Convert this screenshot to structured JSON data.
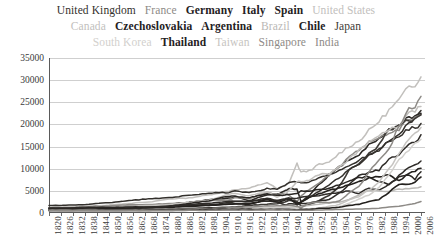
{
  "legend": {
    "rows": [
      [
        {
          "label": "United Kingdom",
          "color": "#33302c",
          "weight": "normal"
        },
        {
          "label": "France",
          "color": "#8d8a86",
          "weight": "normal"
        },
        {
          "label": "Germany",
          "color": "#24211e",
          "weight": "bold"
        },
        {
          "label": "Italy",
          "color": "#24211e",
          "weight": "bold"
        },
        {
          "label": "Spain",
          "color": "#24211e",
          "weight": "bold"
        },
        {
          "label": "United States",
          "color": "#c2c0bd",
          "weight": "normal"
        }
      ],
      [
        {
          "label": "Canada",
          "color": "#c2c0bd",
          "weight": "normal"
        },
        {
          "label": "Czechoslovakia",
          "color": "#24211e",
          "weight": "bold"
        },
        {
          "label": "Argentina",
          "color": "#24211e",
          "weight": "bold"
        },
        {
          "label": "Brazil",
          "color": "#bab8b5",
          "weight": "normal"
        },
        {
          "label": "Chile",
          "color": "#24211e",
          "weight": "bold"
        },
        {
          "label": "Japan",
          "color": "#3d3a36",
          "weight": "normal"
        }
      ],
      [
        {
          "label": "South Korea",
          "color": "#d2d0cd",
          "weight": "normal"
        },
        {
          "label": "Thailand",
          "color": "#24211e",
          "weight": "bold"
        },
        {
          "label": "Taiwan",
          "color": "#c6c4c1",
          "weight": "normal"
        },
        {
          "label": "Singapore",
          "color": "#8d8a86",
          "weight": "normal"
        },
        {
          "label": "India",
          "color": "#8d8a86",
          "weight": "normal"
        }
      ]
    ]
  },
  "chart_data": {
    "type": "line",
    "title": "",
    "xlabel": "",
    "ylabel": "",
    "grid": true,
    "legend_position": "top",
    "xlim": [
      1820,
      2008
    ],
    "ylim": [
      0,
      35000
    ],
    "yticks": [
      0,
      5000,
      10000,
      15000,
      20000,
      25000,
      30000,
      35000
    ],
    "ytick_labels": [
      "0",
      "5000",
      "10000",
      "15000",
      "20000",
      "25000",
      "30000",
      "35000"
    ],
    "xticks": [
      1820,
      1826,
      1832,
      1838,
      1844,
      1850,
      1856,
      1862,
      1868,
      1874,
      1880,
      1886,
      1892,
      1898,
      1904,
      1910,
      1916,
      1922,
      1928,
      1934,
      1940,
      1946,
      1952,
      1958,
      1964,
      1970,
      1976,
      1982,
      1988,
      1994,
      2000,
      2006
    ],
    "xtick_labels": [
      "1820",
      "1826",
      "1832",
      "1838",
      "1844",
      "1850",
      "1856",
      "1862",
      "1868",
      "1874",
      "1880",
      "1886",
      "1892",
      "1898",
      "1904",
      "1910",
      "1916",
      "1922",
      "1928",
      "1934",
      "1940",
      "1946",
      "1952",
      "1958",
      "1964",
      "1970",
      "1976",
      "1982",
      "1988",
      "1994",
      "2000",
      "2006"
    ],
    "x": [
      1820,
      1830,
      1840,
      1850,
      1860,
      1870,
      1880,
      1890,
      1900,
      1910,
      1913,
      1920,
      1929,
      1934,
      1938,
      1940,
      1944,
      1946,
      1950,
      1955,
      1960,
      1965,
      1970,
      1975,
      1980,
      1985,
      1990,
      1995,
      2000,
      2003,
      2006
    ],
    "series": [
      {
        "name": "United States",
        "color": "#c2c0bd",
        "width": 1.5,
        "values": [
          1257,
          1450,
          1588,
          1806,
          2178,
          2445,
          3184,
          3392,
          4091,
          4964,
          5301,
          5552,
          6899,
          5467,
          6126,
          6838,
          11138,
          9197,
          9561,
          10897,
          11328,
          13419,
          15030,
          16284,
          18577,
          20717,
          23201,
          25467,
          28467,
          29037,
          31178
        ]
      },
      {
        "name": "United Kingdom",
        "color": "#33302c",
        "width": 1.5,
        "values": [
          1706,
          1749,
          1990,
          2330,
          2830,
          3190,
          3477,
          4009,
          4492,
          4611,
          4921,
          4548,
          5503,
          5420,
          6266,
          6856,
          7056,
          6745,
          6939,
          7868,
          8645,
          9752,
          10767,
          11993,
          12931,
          14071,
          16430,
          17490,
          20353,
          21310,
          22693
        ]
      },
      {
        "name": "Germany",
        "color": "#2b2825",
        "width": 1.6,
        "values": [
          1077,
          1128,
          1428,
          1428,
          1639,
          1839,
          1991,
          2428,
          2985,
          3348,
          3648,
          2796,
          4051,
          4200,
          4994,
          5403,
          5403,
          2503,
          3881,
          6430,
          8463,
          10403,
          11993,
          13152,
          15370,
          16871,
          18685,
          19534,
          21812,
          21598,
          22300
        ]
      },
      {
        "name": "France",
        "color": "#8d8a86",
        "width": 1.5,
        "values": [
          1135,
          1205,
          1328,
          1597,
          1892,
          1876,
          2120,
          2376,
          2876,
          2965,
          3485,
          3227,
          4710,
          4192,
          4466,
          4042,
          2500,
          3817,
          5271,
          6739,
          8531,
          10409,
          12724,
          14282,
          16042,
          16760,
          18142,
          19012,
          21234,
          21459,
          22223
        ]
      },
      {
        "name": "Japan",
        "color": "#3d3a36",
        "width": 1.6,
        "values": [
          669,
          675,
          685,
          700,
          720,
          737,
          865,
          1012,
          1180,
          1301,
          1387,
          1696,
          2026,
          2120,
          2449,
          2874,
          2643,
          1555,
          1921,
          2771,
          3986,
          5934,
          9714,
          11344,
          13428,
          15331,
          18789,
          19979,
          21069,
          21218,
          22462
        ]
      },
      {
        "name": "Italy",
        "color": "#34312d",
        "width": 1.5,
        "values": [
          1117,
          1140,
          1172,
          1350,
          1459,
          1499,
          1581,
          1667,
          1785,
          2332,
          2564,
          2587,
          3093,
          2842,
          3244,
          3505,
          1809,
          2449,
          3502,
          4921,
          6352,
          7926,
          9719,
          11150,
          13149,
          14251,
          16313,
          17417,
          19054,
          19150,
          19800
        ]
      },
      {
        "name": "Spain",
        "color": "#2e2b28",
        "width": 1.5,
        "values": [
          1008,
          1048,
          1079,
          1079,
          1360,
          1207,
          1654,
          1847,
          1786,
          2056,
          2056,
          2177,
          2739,
          2504,
          1790,
          2080,
          1958,
          2118,
          2189,
          2737,
          3072,
          4429,
          6319,
          8346,
          9203,
          9722,
          12055,
          13217,
          15269,
          16021,
          17500
        ]
      },
      {
        "name": "Canada",
        "color": "#c2c0bd",
        "width": 1.5,
        "values": [
          904,
          900,
          1000,
          1330,
          1550,
          1695,
          1876,
          2378,
          2911,
          4213,
          4447,
          3911,
          4811,
          3600,
          4344,
          5065,
          7208,
          6968,
          7291,
          8753,
          8753,
          10573,
          12050,
          14101,
          16176,
          17694,
          18872,
          19661,
          22488,
          23000,
          24070
        ]
      },
      {
        "name": "Czechoslovakia",
        "color": "#24211e",
        "width": 1.6,
        "values": [
          849,
          860,
          892,
          937,
          1042,
          1164,
          1245,
          1505,
          1729,
          1991,
          2096,
          1933,
          3042,
          2443,
          2882,
          3200,
          2200,
          2430,
          3501,
          4310,
          5108,
          5600,
          6466,
          7041,
          7982,
          8232,
          8513,
          7327,
          8883,
          9500,
          10200
        ]
      },
      {
        "name": "Argentina",
        "color": "#2a2724",
        "width": 1.5,
        "values": [
          998,
          1015,
          1150,
          1250,
          1400,
          1311,
          1468,
          2152,
          2756,
          3822,
          3797,
          3473,
          4367,
          3969,
          4072,
          4161,
          4342,
          4969,
          4987,
          5237,
          5559,
          6371,
          7302,
          7971,
          8206,
          7094,
          6433,
          8137,
          8544,
          7666,
          9500
        ]
      },
      {
        "name": "Chile",
        "color": "#2e2b28",
        "width": 1.5,
        "values": [
          694,
          700,
          720,
          760,
          880,
          1290,
          1538,
          1870,
          2194,
          2653,
          2653,
          2548,
          3396,
          2768,
          3126,
          3188,
          3423,
          3506,
          3821,
          3855,
          4304,
          4543,
          5028,
          4323,
          5680,
          5145,
          6402,
          8473,
          10309,
          10700,
          11600
        ]
      },
      {
        "name": "Brazil",
        "color": "#bab8b5",
        "width": 1.5,
        "values": [
          646,
          640,
          655,
          686,
          710,
          713,
          784,
          794,
          678,
          769,
          811,
          963,
          1137,
          1113,
          1220,
          1250,
          1356,
          1442,
          1672,
          1970,
          2335,
          2449,
          3057,
          4048,
          5198,
          5004,
          4920,
          5331,
          5532,
          5563,
          5900
        ]
      },
      {
        "name": "Taiwan",
        "color": "#c6c4c1",
        "width": 1.5,
        "values": [
          500,
          510,
          520,
          530,
          545,
          560,
          580,
          616,
          759,
          790,
          860,
          948,
          1150,
          1233,
          1302,
          1330,
          1161,
          860,
          936,
          1085,
          1492,
          1885,
          2980,
          3669,
          5260,
          6916,
          9886,
          13174,
          16912,
          17900,
          19500
        ]
      },
      {
        "name": "South Korea",
        "color": "#d2d0cd",
        "width": 1.5,
        "values": [
          600,
          605,
          610,
          618,
          625,
          633,
          645,
          660,
          850,
          900,
          948,
          1038,
          1193,
          1250,
          1459,
          1500,
          1300,
          854,
          854,
          1061,
          1226,
          1436,
          2167,
          3162,
          4114,
          5670,
          8704,
          11873,
          14375,
          15732,
          17000
        ]
      },
      {
        "name": "Singapore",
        "color": "#8d8a86",
        "width": 1.5,
        "values": [
          683,
          690,
          700,
          712,
          728,
          745,
          760,
          780,
          1000,
          1150,
          1279,
          1350,
          1600,
          1600,
          1700,
          1750,
          1500,
          1159,
          2219,
          2523,
          2310,
          2667,
          4439,
          6070,
          9058,
          12240,
          14258,
          19947,
          23353,
          23800,
          26000
        ]
      },
      {
        "name": "Thailand",
        "color": "#24211e",
        "width": 1.6,
        "values": [
          570,
          575,
          580,
          590,
          600,
          608,
          617,
          634,
          812,
          830,
          841,
          848,
          793,
          800,
          826,
          826,
          740,
          817,
          817,
          1031,
          1078,
          1308,
          1694,
          1959,
          2554,
          3054,
          4645,
          6527,
          6398,
          7000,
          8100
        ]
      },
      {
        "name": "India",
        "color": "#8d8a86",
        "width": 1.5,
        "values": [
          533,
          533,
          533,
          533,
          533,
          533,
          526,
          584,
          599,
          697,
          673,
          635,
          728,
          700,
          700,
          686,
          639,
          619,
          619,
          676,
          753,
          785,
          868,
          900,
          938,
          1098,
          1309,
          1528,
          1892,
          2160,
          2600
        ]
      }
    ]
  }
}
